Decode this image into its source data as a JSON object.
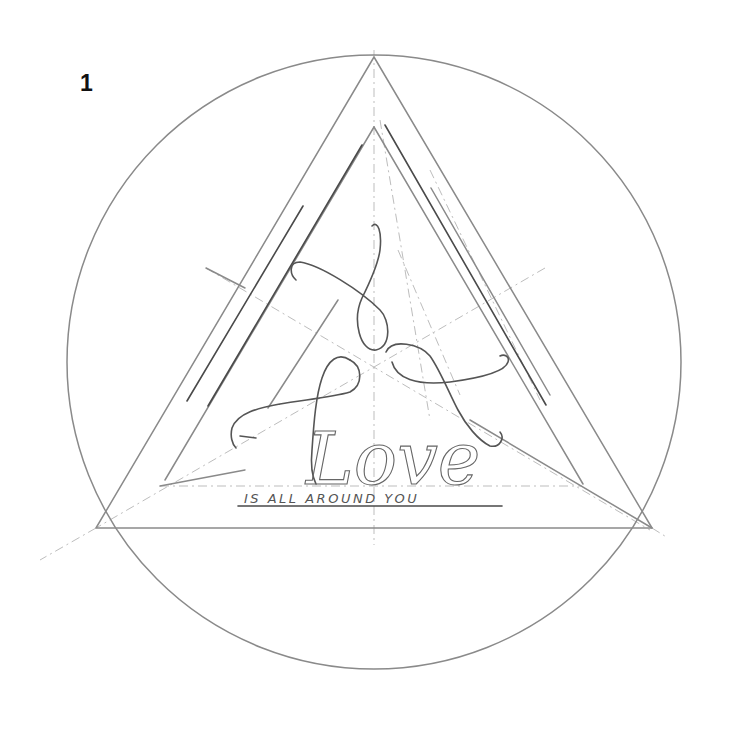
{
  "page": {
    "step_number": "1"
  },
  "artwork": {
    "title_word": "Love",
    "tagline": "IS ALL AROUND YOU",
    "colors": {
      "circle": "#8a8a8a",
      "triangle": "#8a8a8a",
      "inner_lines": "#4a4a4a",
      "guides": "#bdbdbd",
      "script": "#555555",
      "background": "#ffffff"
    },
    "shapes": {
      "circle": {
        "cx": 374,
        "cy": 362,
        "r": 307
      },
      "outer_triangle": [
        "374,57",
        "96,528",
        "652,528"
      ]
    }
  }
}
